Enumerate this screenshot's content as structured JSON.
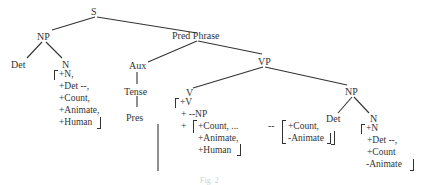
{
  "nodes": {
    "S": "S",
    "NP1": "NP",
    "Det1": "Det",
    "N1": "N",
    "PredPhrase": "Pred Phrase",
    "Aux": "Aux",
    "Tense": "Tense",
    "Pres": "Pres",
    "VP": "VP",
    "V": "V",
    "NP2": "NP",
    "Det2": "Det",
    "N2": "N"
  },
  "features": {
    "N1": [
      "+N,",
      "+Det --,",
      "+Count,",
      "+Animate,",
      "+Human"
    ],
    "V": {
      "head": "+V",
      "frame": "+ --NP",
      "plus": "+",
      "subject": [
        "+Count, ...",
        "+Animate,",
        "+Human"
      ],
      "dash": "--",
      "object": [
        "+Count,",
        "-Animate"
      ]
    },
    "N2": [
      "+N",
      "+Det --,",
      "+Count",
      "-Animate"
    ]
  },
  "caption": "Fig. 2"
}
